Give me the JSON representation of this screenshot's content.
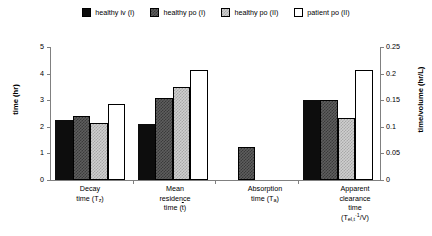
{
  "chart_data": {
    "type": "bar",
    "title": "",
    "subtitle": "",
    "xlabel": "",
    "ylabel": "time (hr)",
    "ylabel_secondary": "time/volume (hr/L)",
    "ylim": [
      0,
      5
    ],
    "ylim_secondary": [
      0,
      0.25
    ],
    "yticks": [
      "0",
      "1",
      "2",
      "3",
      "4",
      "5"
    ],
    "yticks_secondary": [
      "0",
      "0.05",
      "0.1",
      "0.15",
      "0.2",
      "0.25"
    ],
    "grid": false,
    "legend_position": "top-center",
    "categories": [
      "Decay time (Tz)",
      "Mean residence time (t)",
      "Absorption time (Ta)",
      "Apparent clearance time (Tel,t ·1/V)"
    ],
    "category_labels": [
      {
        "line1": "Decay",
        "line2": "time (T",
        "sub2": "z",
        "line2_end": ")"
      },
      {
        "line1": "Mean",
        "line2": "residence",
        "line3": "time (t",
        "line3_end": ")"
      },
      {
        "line1": "Absorption",
        "line2": "time (T",
        "sub2": "a",
        "line2_end": ")"
      },
      {
        "line1": "Apparent",
        "line2": "clearance",
        "line3": "time",
        "line4": "(T",
        "sub4": "el,t",
        "sup4": "·1",
        "line4_end": "/V)"
      }
    ],
    "series": [
      {
        "name": "healthy iv (I)",
        "pattern": "solid-black",
        "color": "#0d0d0d",
        "values": [
          2.25,
          2.1,
          null,
          3.0
        ],
        "axis": [
          "left",
          "left",
          "left",
          "right"
        ]
      },
      {
        "name": "healthy po (I)",
        "pattern": "dark-check",
        "color": "#5e5e5e",
        "values": [
          2.4,
          3.1,
          1.25,
          3.0
        ],
        "axis": [
          "left",
          "left",
          "left",
          "right"
        ]
      },
      {
        "name": "healthy po (II)",
        "pattern": "light-check",
        "color": "#cfcfcf",
        "values": [
          2.15,
          3.5,
          null,
          2.35
        ],
        "axis": [
          "left",
          "left",
          "left",
          "right"
        ]
      },
      {
        "name": "patient po (II)",
        "pattern": "white",
        "color": "#ffffff",
        "values": [
          2.85,
          4.15,
          null,
          4.15
        ],
        "axis": [
          "left",
          "left",
          "left",
          "right"
        ]
      }
    ],
    "secondary_axis_note": "Fourth category (apparent clearance time) is read on the right-hand time/volume axis: 3.00 hr-units ≈ 0.15 hr/L, 2.35 ≈ 0.1175 hr/L, 4.15 ≈ 0.2075 hr/L"
  },
  "legend": {
    "items": [
      {
        "label": "healthy iv (I)",
        "pattern": "solid-black"
      },
      {
        "label": "healthy po (I)",
        "pattern": "dark-check"
      },
      {
        "label": "healthy po (II)",
        "pattern": "light-check"
      },
      {
        "label": "patient po (II)",
        "pattern": "white"
      }
    ]
  },
  "axes": {
    "left": {
      "title": "time (hr)",
      "ticks": [
        "5",
        "4",
        "3",
        "2",
        "1",
        "0"
      ]
    },
    "right": {
      "title": "time/volume (hr/L)",
      "ticks": [
        "0.25",
        "0.2",
        "0.15",
        "0.1",
        "0.05",
        "0"
      ]
    }
  }
}
